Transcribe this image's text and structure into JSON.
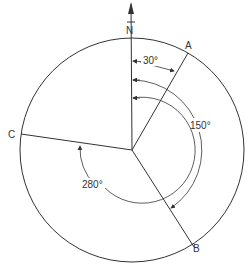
{
  "diagram": {
    "type": "bearing-diagram",
    "north_label": "N",
    "points": [
      {
        "label": "A",
        "bearing_deg": 30
      },
      {
        "label": "B",
        "bearing_deg": 150
      },
      {
        "label": "C",
        "bearing_deg": 280
      }
    ],
    "angle_labels": {
      "a": "30°",
      "b": "150°",
      "c": "280°"
    },
    "colors": {
      "stroke": "#333333",
      "background": "#ffffff"
    }
  }
}
